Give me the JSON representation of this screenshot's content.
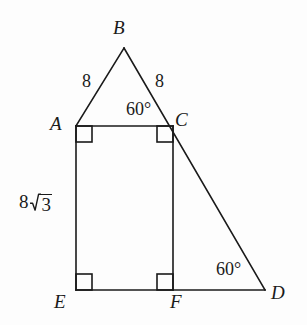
{
  "figure": {
    "background_color": "#fdfdfd",
    "stroke_color": "#1a1a1a",
    "stroke_width": 1.6,
    "width": 307,
    "height": 325,
    "vertices": [
      {
        "name": "B",
        "label": "B",
        "x": 124,
        "y": 48,
        "label_x": 113,
        "label_y": 18
      },
      {
        "name": "A",
        "label": "A",
        "x": 76,
        "y": 126,
        "label_x": 50,
        "label_y": 114
      },
      {
        "name": "C",
        "label": "C",
        "x": 173,
        "y": 126,
        "label_x": 175,
        "label_y": 110
      },
      {
        "name": "E",
        "label": "E",
        "x": 76,
        "y": 290,
        "label_x": 54,
        "label_y": 292
      },
      {
        "name": "F",
        "label": "F",
        "x": 173,
        "y": 290,
        "label_x": 170,
        "label_y": 292
      },
      {
        "name": "D",
        "label": "D",
        "x": 265,
        "y": 290,
        "label_x": 271,
        "label_y": 283
      }
    ],
    "segments": [
      {
        "name": "segment-AB",
        "from": "A",
        "to": "B"
      },
      {
        "name": "segment-BD",
        "from": "B",
        "to": "D"
      },
      {
        "name": "segment-AC",
        "from": "A",
        "to": "C"
      },
      {
        "name": "segment-AE",
        "from": "A",
        "to": "E"
      },
      {
        "name": "segment-CF",
        "from": "C",
        "to": "F"
      },
      {
        "name": "segment-ED",
        "from": "E",
        "to": "D"
      }
    ],
    "right_angle_marks": [
      {
        "name": "right-angle-A",
        "at": "A",
        "dx": 1,
        "dy": 1
      },
      {
        "name": "right-angle-C",
        "at": "C",
        "dx": -1,
        "dy": 1
      },
      {
        "name": "right-angle-E",
        "at": "E",
        "dx": 1,
        "dy": -1
      },
      {
        "name": "right-angle-F",
        "at": "F",
        "dx": -1,
        "dy": -1
      }
    ],
    "side_labels": [
      {
        "name": "length-AB",
        "text": "8",
        "x": 82,
        "y": 72
      },
      {
        "name": "length-BC",
        "text": "8",
        "x": 155,
        "y": 72
      }
    ],
    "angle_labels": [
      {
        "name": "angle-BCA",
        "text": "60°",
        "x": 126,
        "y": 100
      },
      {
        "name": "angle-FDC",
        "text": "60°",
        "x": 216,
        "y": 260
      }
    ],
    "radical_label": {
      "name": "length-AE",
      "coefficient": "8",
      "radicand": "3",
      "text": "8√3",
      "x": 19,
      "y": 192
    }
  }
}
